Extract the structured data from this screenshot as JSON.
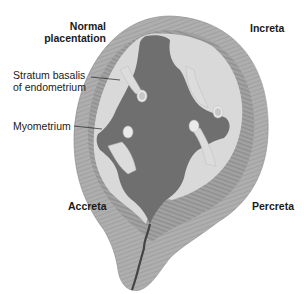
{
  "figure": {
    "labels": {
      "normal_line1": "Normal",
      "normal_line2": "placentation",
      "increta": "Increta",
      "accreta": "Accreta",
      "percreta": "Percreta",
      "stratum_line1": "Stratum basalis",
      "stratum_line2": "of endometrium",
      "myometrium": "Myometrium"
    },
    "colors": {
      "myometrium": "#a9a9a9",
      "endometrium": "#9c9c9c",
      "placenta": "#d9d9d9",
      "cavity": "#6f6f6f",
      "text": "#1a1a1a"
    }
  }
}
